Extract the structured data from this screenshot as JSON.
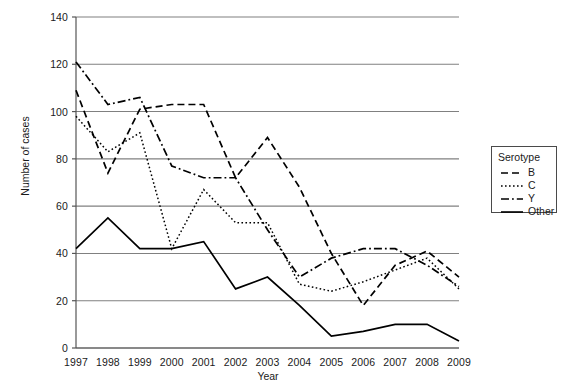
{
  "chart_data": {
    "type": "line",
    "title": "",
    "xlabel": "Year",
    "ylabel": "Number of cases",
    "categories": [
      1997,
      1998,
      1999,
      2000,
      2001,
      2002,
      2003,
      2004,
      2005,
      2006,
      2007,
      2008,
      2009
    ],
    "x": [
      1997,
      1998,
      1999,
      2000,
      2001,
      2002,
      2003,
      2004,
      2005,
      2006,
      2007,
      2008,
      2009
    ],
    "xlim": [
      1997,
      2009
    ],
    "ylim": [
      0,
      140
    ],
    "yticks": [
      0,
      20,
      40,
      60,
      80,
      100,
      120,
      140
    ],
    "xticks": [
      1997,
      1998,
      1999,
      2000,
      2001,
      2002,
      2003,
      2004,
      2005,
      2006,
      2007,
      2008,
      2009
    ],
    "grid": "horizontal",
    "legend_position": "right-outside",
    "legend_title": "Serotype",
    "series": [
      {
        "name": "B",
        "dash": "dashed",
        "color": "#000000",
        "values": [
          109,
          74,
          101,
          103,
          103,
          72,
          89,
          68,
          40,
          18,
          35,
          41,
          30
        ]
      },
      {
        "name": "C",
        "dash": "dotted",
        "color": "#000000",
        "values": [
          98,
          83,
          91,
          42,
          67,
          53,
          53,
          27,
          24,
          28,
          33,
          38,
          25
        ]
      },
      {
        "name": "Y",
        "dash": "dashdot",
        "color": "#000000",
        "values": [
          121,
          103,
          106,
          77,
          72,
          72,
          50,
          30,
          38,
          42,
          42,
          35,
          26
        ]
      },
      {
        "name": "Other",
        "dash": "solid",
        "color": "#000000",
        "values": [
          42,
          55,
          42,
          42,
          45,
          25,
          30,
          18,
          5,
          7,
          10,
          10,
          3
        ]
      }
    ]
  },
  "axes": {
    "ylabel": "Number of cases",
    "xlabel": "Year",
    "ytick_labels": [
      "0",
      "20",
      "40",
      "60",
      "80",
      "100",
      "120",
      "140"
    ],
    "xtick_labels": [
      "1997",
      "1998",
      "1999",
      "2000",
      "2001",
      "2002",
      "2003",
      "2004",
      "2005",
      "2006",
      "2007",
      "2008",
      "2009"
    ]
  },
  "legend": {
    "title": "Serotype",
    "items": [
      {
        "label": "B"
      },
      {
        "label": "C"
      },
      {
        "label": "Y"
      },
      {
        "label": "Other"
      }
    ]
  },
  "colors": {
    "line": "#000000",
    "grid": "#808080",
    "axis": "#555555",
    "text": "#1a1a1a"
  }
}
